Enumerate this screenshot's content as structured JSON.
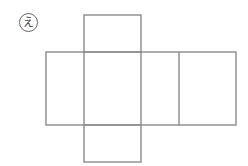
{
  "label": "え",
  "figure": {
    "line_color": "#8a8a8a",
    "row": {
      "x": [
        46,
        84,
        141,
        179,
        236
      ],
      "y_top": 52,
      "y_bottom": 125
    },
    "top_square": {
      "x1": 84,
      "x2": 141,
      "y1": 15,
      "y2": 52
    },
    "bottom_square": {
      "x1": 84,
      "x2": 141,
      "y1": 125,
      "y2": 162
    }
  }
}
